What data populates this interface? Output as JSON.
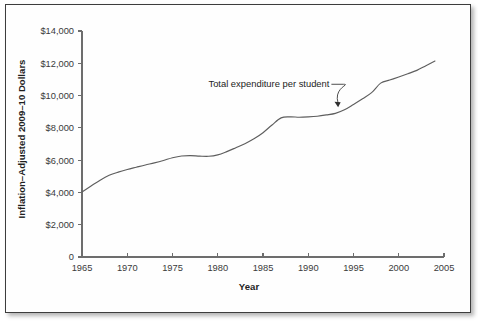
{
  "figure": {
    "frame_color": "#3d3d3d",
    "background": "#ffffff",
    "line_color": "#5e5e5e"
  },
  "chart_data": {
    "type": "line",
    "title": "",
    "xlabel": "Year",
    "ylabel": "Inflation–Adjusted 2009–10 Dollars",
    "xlim": [
      1965,
      2005
    ],
    "ylim": [
      0,
      14000
    ],
    "grid": false,
    "legend_position": "none",
    "xticks": [
      1965,
      1970,
      1975,
      1980,
      1985,
      1990,
      1995,
      2000,
      2005
    ],
    "xtick_labels": [
      "1965",
      "1970",
      "1975",
      "1980",
      "1985",
      "1990",
      "1995",
      "2000",
      "2005"
    ],
    "yticks": [
      0,
      2000,
      4000,
      6000,
      8000,
      10000,
      12000,
      14000
    ],
    "ytick_labels": [
      "0",
      "$2,000",
      "$4,000",
      "$6,000",
      "$8,000",
      "$10,000",
      "$12,000",
      "$14,000"
    ],
    "series": [
      {
        "name": "Total expenditure per student",
        "x": [
          1965,
          1966,
          1967,
          1968,
          1969,
          1970,
          1971,
          1972,
          1973,
          1974,
          1975,
          1976,
          1977,
          1978,
          1979,
          1980,
          1981,
          1982,
          1983,
          1984,
          1985,
          1986,
          1987,
          1988,
          1989,
          1990,
          1991,
          1992,
          1993,
          1994,
          1995,
          1996,
          1997,
          1998,
          1999,
          2000,
          2001,
          2002,
          2003,
          2004
        ],
        "y": [
          4030,
          4400,
          4760,
          5060,
          5260,
          5420,
          5560,
          5700,
          5830,
          5980,
          6150,
          6260,
          6280,
          6250,
          6240,
          6330,
          6530,
          6770,
          7020,
          7320,
          7700,
          8180,
          8620,
          8680,
          8660,
          8680,
          8720,
          8800,
          8900,
          9120,
          9450,
          9800,
          10180,
          10770,
          10960,
          11150,
          11350,
          11560,
          11850,
          12140
        ]
      }
    ],
    "annotations": [
      {
        "text": "Total expenditure per student",
        "label_x": 1993.0,
        "label_y": 10700,
        "points_to_x": 1993.3,
        "points_to_y": 9280
      }
    ]
  }
}
